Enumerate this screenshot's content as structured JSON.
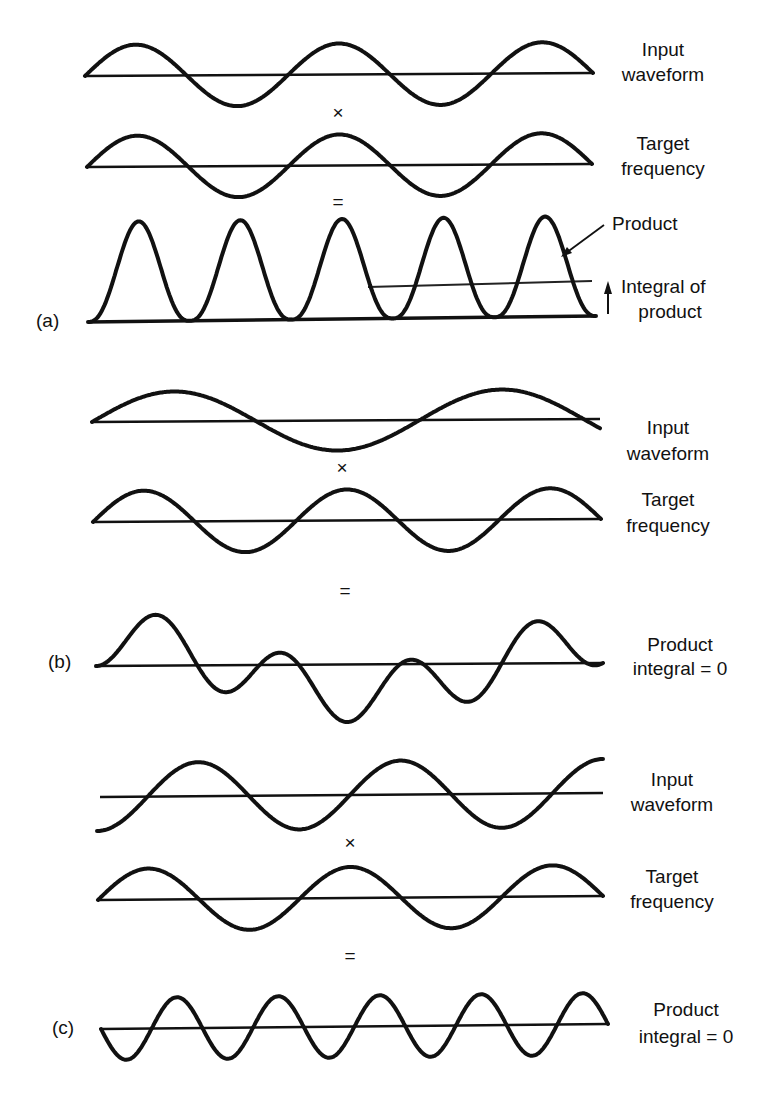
{
  "chart_data": {
    "type": "line",
    "title": "",
    "panels": [
      {
        "id": "a",
        "panel_label": "(a)",
        "input": {
          "label_lines": [
            "Input",
            "waveform"
          ],
          "function": "sin",
          "cycles": 2.5,
          "amplitude": 1.0,
          "phase_deg": 0
        },
        "multiply_symbol": "×",
        "target": {
          "label_lines": [
            "Target",
            "frequency"
          ],
          "function": "sin",
          "cycles": 2.5,
          "amplitude": 1.0,
          "phase_deg": 0
        },
        "equals_symbol": "=",
        "product": {
          "label_lines": [
            "Product"
          ],
          "function": "input*target",
          "lobes": 5,
          "sign": "all positive"
        },
        "integral": {
          "label_lines": [
            "Integral of",
            "product"
          ],
          "value_relative": 0.35,
          "result": "nonzero (positive)"
        }
      },
      {
        "id": "b",
        "panel_label": "(b)",
        "input": {
          "label_lines": [
            "Input",
            "waveform"
          ],
          "function": "sin",
          "cycles": 1.55,
          "amplitude": 1.0,
          "phase_deg": 0
        },
        "multiply_symbol": "×",
        "target": {
          "label_lines": [
            "Target",
            "frequency"
          ],
          "function": "sin",
          "cycles": 2.5,
          "amplitude": 1.0,
          "phase_deg": 0
        },
        "equals_symbol": "=",
        "product": {
          "label_lines": [
            "Product",
            "integral = 0"
          ],
          "function": "input*target",
          "integral": 0
        }
      },
      {
        "id": "c",
        "panel_label": "(c)",
        "input": {
          "label_lines": [
            "Input",
            "waveform"
          ],
          "function": "sin",
          "cycles": 2.5,
          "amplitude": 1.0,
          "phase_deg": -90
        },
        "multiply_symbol": "×",
        "target": {
          "label_lines": [
            "Target",
            "frequency"
          ],
          "function": "sin",
          "cycles": 2.5,
          "amplitude": 1.0,
          "phase_deg": 0
        },
        "equals_symbol": "=",
        "product": {
          "label_lines": [
            "Product",
            "integral = 0"
          ],
          "function": "input*target",
          "lobes": 10,
          "integral": 0
        }
      }
    ]
  },
  "annotations": {
    "product_arrow": "arrow-pointing-to-product-curve",
    "integral_arrow": "up-arrow-indicating-integral-level"
  }
}
